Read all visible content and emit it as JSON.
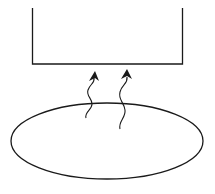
{
  "diagram": {
    "colors": {
      "stroke": "#1a1a1a",
      "background": "#ffffff"
    },
    "shapes": {
      "container": "open-top rectangle",
      "source": "ellipse",
      "arrows": [
        "wavy-arrow-left",
        "wavy-arrow-right"
      ]
    }
  }
}
